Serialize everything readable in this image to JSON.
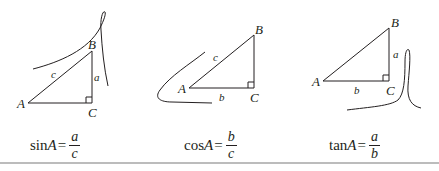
{
  "panels": [
    {
      "id": "sin",
      "vertices": {
        "A": "A",
        "B": "B",
        "C": "C"
      },
      "sides": {
        "hyp": "c",
        "opp": "a"
      },
      "formula": {
        "fn": "sin",
        "var": "A",
        "eq": "=",
        "num": "a",
        "den": "c"
      }
    },
    {
      "id": "cos",
      "vertices": {
        "A": "A",
        "B": "B",
        "C": "C"
      },
      "sides": {
        "hyp": "c",
        "adj": "b"
      },
      "formula": {
        "fn": "cos",
        "var": "A",
        "eq": "=",
        "num": "b",
        "den": "c"
      }
    },
    {
      "id": "tan",
      "vertices": {
        "A": "A",
        "B": "B",
        "C": "C"
      },
      "sides": {
        "opp": "a",
        "adj": "b"
      },
      "formula": {
        "fn": "tan",
        "var": "A",
        "eq": "=",
        "num": "a",
        "den": "b"
      }
    }
  ],
  "colors": {
    "ink": "#231f20",
    "rule": "#bcbcbc"
  }
}
